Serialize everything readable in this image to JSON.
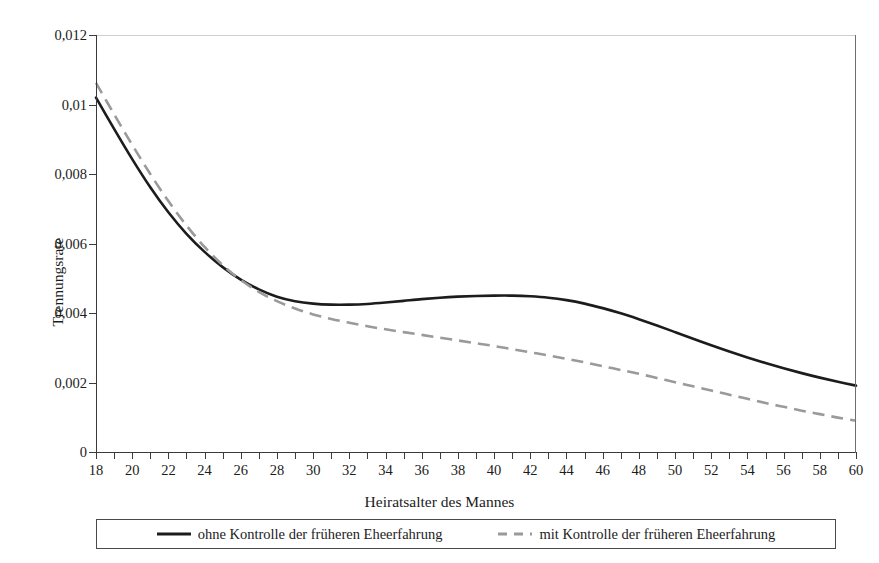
{
  "figure": {
    "title_remnant": "",
    "background_color": "#ffffff"
  },
  "axes": {
    "y": {
      "title": "Trennungsrate",
      "tick_labels": [
        "0",
        "0,002",
        "0,004",
        "0,006",
        "0,008",
        "0,01",
        "0,012"
      ],
      "tick_values": [
        0,
        0.002,
        0.004,
        0.006,
        0.008,
        0.01,
        0.012
      ],
      "min": 0,
      "max": 0.012
    },
    "x": {
      "title": "Heiratsalter des Mannes",
      "tick_labels": [
        "18",
        "20",
        "22",
        "24",
        "26",
        "28",
        "30",
        "32",
        "34",
        "36",
        "38",
        "40",
        "42",
        "44",
        "46",
        "48",
        "50",
        "52",
        "54",
        "56",
        "58",
        "60"
      ],
      "tick_values": [
        18,
        20,
        22,
        24,
        26,
        28,
        30,
        32,
        34,
        36,
        38,
        40,
        42,
        44,
        46,
        48,
        50,
        52,
        54,
        56,
        58,
        60
      ],
      "minor_tick_step": 1,
      "min": 18,
      "max": 60
    }
  },
  "legend": {
    "position": "bottom",
    "items": [
      {
        "label": "ohne Kontrolle der früheren Eheerfahrung",
        "style": "solid",
        "color": "#1c1c1c"
      },
      {
        "label": "mit Kontrolle der früheren Eheerfahrung",
        "style": "dashed",
        "color": "#9a9a9a"
      }
    ]
  },
  "chart_data": {
    "type": "line",
    "title": "",
    "xlabel": "Heiratsalter des Mannes",
    "ylabel": "Trennungsrate",
    "xlim": [
      18,
      60
    ],
    "ylim": [
      0,
      0.012
    ],
    "grid": false,
    "legend_position": "bottom",
    "x": [
      18,
      19,
      20,
      21,
      22,
      23,
      24,
      25,
      26,
      27,
      28,
      29,
      30,
      31,
      32,
      33,
      34,
      35,
      36,
      37,
      38,
      39,
      40,
      41,
      42,
      43,
      44,
      45,
      46,
      47,
      48,
      49,
      50,
      51,
      52,
      53,
      54,
      55,
      56,
      57,
      58,
      59,
      60
    ],
    "series": [
      {
        "name": "ohne Kontrolle der früheren Eheerfahrung",
        "style": "solid",
        "color": "#1c1c1c",
        "values": [
          0.0102,
          0.0093,
          0.00843,
          0.00762,
          0.0069,
          0.00628,
          0.00576,
          0.00532,
          0.00496,
          0.00468,
          0.00447,
          0.00434,
          0.00427,
          0.00424,
          0.00424,
          0.00426,
          0.0043,
          0.00435,
          0.0044,
          0.00444,
          0.00447,
          0.00449,
          0.0045,
          0.0045,
          0.00448,
          0.00444,
          0.00437,
          0.00427,
          0.00414,
          0.00399,
          0.00382,
          0.00364,
          0.00345,
          0.00326,
          0.00307,
          0.00289,
          0.00272,
          0.00256,
          0.00241,
          0.00227,
          0.00214,
          0.00202,
          0.00191
        ]
      },
      {
        "name": "mit Kontrolle der früheren Eheerfahrung",
        "style": "dashed",
        "color": "#9a9a9a",
        "values": [
          0.01062,
          0.00972,
          0.00884,
          0.008,
          0.00722,
          0.00652,
          0.0059,
          0.00538,
          0.00495,
          0.00461,
          0.00434,
          0.00413,
          0.00396,
          0.00383,
          0.00372,
          0.00362,
          0.00353,
          0.00345,
          0.00337,
          0.00329,
          0.00321,
          0.00313,
          0.00305,
          0.00296,
          0.00287,
          0.00278,
          0.00268,
          0.00258,
          0.00247,
          0.00236,
          0.00225,
          0.00213,
          0.00201,
          0.00189,
          0.00177,
          0.00165,
          0.00153,
          0.00141,
          0.0013,
          0.00119,
          0.00109,
          0.00099,
          0.0009
        ]
      }
    ]
  }
}
